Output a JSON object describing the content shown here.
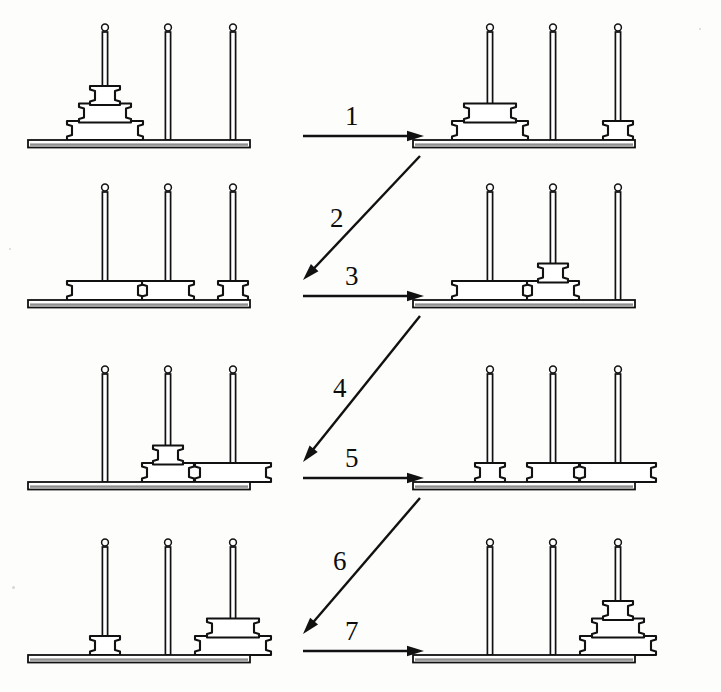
{
  "figure": {
    "peg_count": 3,
    "disk_count": 3,
    "peg_names": [
      "A",
      "B",
      "C"
    ],
    "disk_names": [
      "small",
      "medium",
      "large"
    ],
    "ink_color": "#111111",
    "paper_color": "#fdfdfc",
    "panel_count": 8,
    "arrow_count": 7
  },
  "steps": [
    {
      "number": "1",
      "direction": "right",
      "from_panel": 0,
      "to_panel": 1,
      "move": "small disk from peg A to peg C"
    },
    {
      "number": "2",
      "direction": "down-left",
      "from_panel": 1,
      "to_panel": 2,
      "move": "medium disk from peg A to peg B"
    },
    {
      "number": "3",
      "direction": "right",
      "from_panel": 2,
      "to_panel": 3,
      "move": "small disk from peg C to peg B"
    },
    {
      "number": "4",
      "direction": "down-left",
      "from_panel": 3,
      "to_panel": 4,
      "move": "large disk from peg A to peg C"
    },
    {
      "number": "5",
      "direction": "right",
      "from_panel": 4,
      "to_panel": 5,
      "move": "small disk from peg B to peg A"
    },
    {
      "number": "6",
      "direction": "down-left",
      "from_panel": 5,
      "to_panel": 6,
      "move": "medium disk from peg B to peg C"
    },
    {
      "number": "7",
      "direction": "right",
      "from_panel": 6,
      "to_panel": 7,
      "move": "small disk from peg A to peg C"
    }
  ],
  "panels": [
    {
      "id": "panel-0",
      "row": 0,
      "side": "left",
      "caption": "initial state",
      "pegs": [
        [
          3,
          2,
          1
        ],
        [],
        []
      ]
    },
    {
      "id": "panel-1",
      "row": 0,
      "side": "right",
      "caption": "after move 1",
      "pegs": [
        [
          3,
          2
        ],
        [],
        [
          1
        ]
      ]
    },
    {
      "id": "panel-2",
      "row": 1,
      "side": "left",
      "caption": "after move 2",
      "pegs": [
        [
          3
        ],
        [
          2
        ],
        [
          1
        ]
      ]
    },
    {
      "id": "panel-3",
      "row": 1,
      "side": "right",
      "caption": "after move 3",
      "pegs": [
        [
          3
        ],
        [
          2,
          1
        ],
        []
      ]
    },
    {
      "id": "panel-4",
      "row": 2,
      "side": "left",
      "caption": "after move 4",
      "pegs": [
        [],
        [
          2,
          1
        ],
        [
          3
        ]
      ]
    },
    {
      "id": "panel-5",
      "row": 2,
      "side": "right",
      "caption": "after move 5",
      "pegs": [
        [
          1
        ],
        [
          2
        ],
        [
          3
        ]
      ]
    },
    {
      "id": "panel-6",
      "row": 3,
      "side": "left",
      "caption": "after move 6",
      "pegs": [
        [
          1
        ],
        [],
        [
          3,
          2
        ]
      ]
    },
    {
      "id": "panel-7",
      "row": 3,
      "side": "right",
      "caption": "final state",
      "pegs": [
        [],
        [],
        [
          3,
          2,
          1
        ]
      ]
    }
  ]
}
